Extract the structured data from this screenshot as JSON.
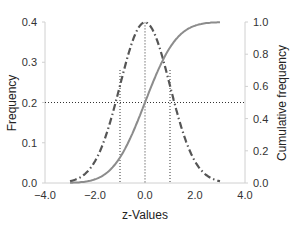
{
  "chart_data": {
    "type": "line",
    "title": "",
    "xlabel": "z-Values",
    "ylabel": "Frequency",
    "y2label": "Cumulative frequency",
    "xlim": [
      -4.0,
      4.0
    ],
    "ylim": [
      0.0,
      0.4
    ],
    "y2lim": [
      0.0,
      1.0
    ],
    "x_ticks": [
      "−4.0",
      "−2.0",
      "0.0",
      "2.0",
      "4.0"
    ],
    "y_ticks": [
      "0.0",
      "0.1",
      "0.2",
      "0.3",
      "0.4"
    ],
    "y2_ticks": [
      "0.0",
      "0.2",
      "0.4",
      "0.6",
      "0.8",
      "1.0"
    ],
    "grid": false,
    "legend": null,
    "series": [
      {
        "name": "Frequency (normal pdf)",
        "axis": "left",
        "style": "dash-dot",
        "color": "#555555",
        "x": [
          -3.0,
          -2.5,
          -2.0,
          -1.5,
          -1.0,
          -0.5,
          0.0,
          0.5,
          1.0,
          1.5,
          2.0,
          2.5,
          3.0
        ],
        "values": [
          0.004,
          0.018,
          0.054,
          0.13,
          0.242,
          0.352,
          0.399,
          0.352,
          0.242,
          0.13,
          0.054,
          0.018,
          0.004
        ]
      },
      {
        "name": "Cumulative frequency (normal cdf)",
        "axis": "right",
        "style": "solid",
        "color": "#8c8c8c",
        "x": [
          -3.0,
          -2.5,
          -2.0,
          -1.5,
          -1.0,
          -0.5,
          0.0,
          0.5,
          1.0,
          1.5,
          2.0,
          2.5,
          3.0
        ],
        "values": [
          0.001,
          0.006,
          0.023,
          0.067,
          0.159,
          0.309,
          0.5,
          0.691,
          0.841,
          0.933,
          0.977,
          0.994,
          0.999
        ]
      }
    ],
    "annotations": [
      {
        "type": "vline",
        "x": -1.0,
        "style": "dotted"
      },
      {
        "type": "vline",
        "x": 0.0,
        "style": "dotted"
      },
      {
        "type": "vline",
        "x": 1.0,
        "style": "dotted"
      },
      {
        "type": "hline",
        "y": 0.2,
        "y2": 0.5,
        "style": "dotted"
      }
    ]
  }
}
